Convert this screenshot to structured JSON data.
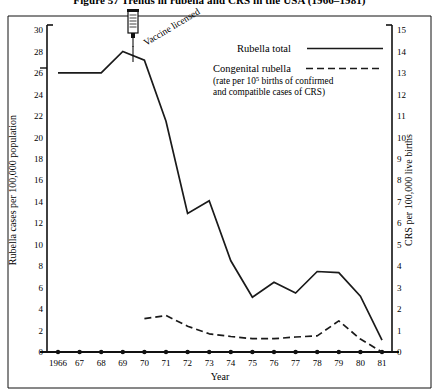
{
  "figure": {
    "title": "Figure 57   Trends in rubella and CRS in the USA (1966–1981)"
  },
  "annotation": {
    "vaccine_label": "Vaccine licensed",
    "icon": "syringe-icon"
  },
  "legend": {
    "entries": [
      {
        "label": "Rubella total",
        "style": "solid"
      },
      {
        "label": "Congenital rubella",
        "style": "dashed"
      }
    ],
    "note_line1": "(rate per 10",
    "note_sup": "5",
    "note_line1b": " births of confirmed",
    "note_line2": "and compatible cases of CRS)"
  },
  "chart_data": {
    "type": "line",
    "title": "Figure 57   Trends in rubella and CRS in the USA (1966–1981)",
    "xlabel": "Year",
    "ylabel": "Rubella cases per 100,000 population",
    "y2label": "CRS per 100,000 live births",
    "grid": false,
    "legend_position": "top-right",
    "x": [
      1966,
      1967,
      1968,
      1969,
      1970,
      1971,
      1972,
      1973,
      1974,
      1975,
      1976,
      1977,
      1978,
      1979,
      1980,
      1981
    ],
    "categories": [
      "1966",
      "67",
      "68",
      "69",
      "70",
      "71",
      "72",
      "73",
      "74",
      "75",
      "76",
      "77",
      "78",
      "79",
      "80",
      "81"
    ],
    "xlim": [
      1966,
      1981
    ],
    "ylim": [
      0,
      30
    ],
    "y2lim": [
      0,
      15
    ],
    "yticks": [
      0,
      2,
      4,
      6,
      8,
      10,
      12,
      14,
      16,
      18,
      20,
      22,
      24,
      26,
      28,
      30
    ],
    "y2ticks": [
      0,
      1,
      2,
      3,
      4,
      5,
      6,
      7,
      8,
      9,
      10,
      11,
      12,
      13,
      14,
      15
    ],
    "series": [
      {
        "name": "Rubella total",
        "axis": "left",
        "style": "solid",
        "color": "#1a1a1a",
        "values": [
          26.0,
          26.0,
          26.0,
          28.0,
          27.2,
          21.5,
          12.9,
          14.1,
          8.5,
          5.1,
          6.5,
          5.5,
          7.5,
          7.4,
          5.2,
          1.1
        ]
      },
      {
        "name": "Congenital rubella",
        "axis": "right",
        "style": "dashed",
        "color": "#1a1a1a",
        "values": [
          null,
          null,
          null,
          null,
          1.55,
          1.7,
          1.2,
          0.85,
          0.72,
          0.62,
          0.62,
          0.7,
          0.75,
          1.45,
          0.6,
          0.0
        ]
      }
    ],
    "annotations": [
      {
        "text": "Vaccine licensed",
        "x": 1969,
        "y": 28.0,
        "icon": "syringe-icon"
      }
    ]
  },
  "axes": {
    "left_title": "Rubella cases per 100,000 population",
    "right_title": "CRS per 100,000 live births",
    "x_title": "Year"
  }
}
